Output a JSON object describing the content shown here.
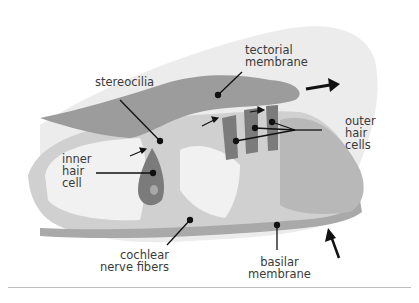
{
  "figure": {
    "labels": {
      "stereocilia": "stereocilia",
      "tectorial_membrane": "tectorial\nmembrane",
      "outer_hair_cells": "outer\nhair\ncells",
      "inner_hair_cell": "inner\nhair\ncell",
      "cochlear_nerve_fibers": "cochlear\nnerve fibers",
      "basilar_membrane": "basilar\nmembrane"
    },
    "arrows": [
      {
        "name": "tectorial-motion-arrow",
        "direction": "right"
      },
      {
        "name": "basilar-motion-arrow",
        "direction": "up-left"
      }
    ],
    "colors": {
      "background": "#ffffff",
      "outer_region": "#e9e9e9",
      "tectorial": "#9a9a9a",
      "tissue_light": "#c8c8c8",
      "tissue_mid": "#b4b4b4",
      "hair_cell": "#7a7a7a",
      "nucleus": "#a8a8a8",
      "fluid": "#f2f2f2",
      "leader": "#111111"
    }
  }
}
